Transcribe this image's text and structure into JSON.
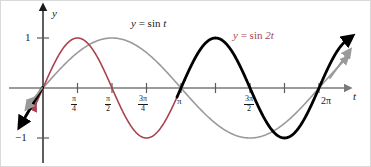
{
  "figure": {
    "kind": "math-graph",
    "width": 371,
    "height": 167,
    "background": "#ffffff",
    "border_color": "#d9d9d9"
  },
  "axes": {
    "t_axis": {
      "label": "t",
      "color": "#7a7a7a",
      "y_pixel": 87,
      "arrow": "right"
    },
    "y_axis": {
      "label": "y",
      "color": "#1a1a1a",
      "x_pixel": 42,
      "arrow": "up"
    },
    "origin": {
      "x": 42,
      "y": 87
    },
    "x_unit_px_per_quarter_pi": 34.5,
    "y_unit_px_per_one": 50,
    "xlim_labels": [
      "0",
      "2π"
    ],
    "ylim": [
      -1,
      1
    ]
  },
  "y_ticks": [
    {
      "label": "1",
      "value": 1
    },
    {
      "label": "−1",
      "value": -1
    }
  ],
  "x_ticks": [
    {
      "num": "π",
      "den": "4",
      "value": 0.7853981634,
      "whole": null
    },
    {
      "num": "π",
      "den": "2",
      "value": 1.5707963268,
      "whole": null
    },
    {
      "num": "3π",
      "den": "4",
      "value": 2.3561944902,
      "whole": null
    },
    {
      "num": null,
      "den": null,
      "value": 3.1415926536,
      "whole": "π"
    },
    {
      "num": "3π",
      "den": "2",
      "value": 4.7123889804,
      "whole": null
    },
    {
      "num": null,
      "den": null,
      "value": 6.2831853072,
      "whole": "2π"
    }
  ],
  "curve_labels": {
    "sin_t": {
      "y": "y",
      "eq": "=",
      "expr": "sin",
      "arg": "t",
      "color": "#1a1a1a"
    },
    "sin_2t": {
      "y": "y",
      "eq": "=",
      "expr": "sin",
      "arg": "2t",
      "color": "#a8434f"
    }
  },
  "chart_data": {
    "type": "line",
    "title": "",
    "xlabel": "t",
    "ylabel": "y",
    "xlim": [
      -0.35,
      7.05
    ],
    "ylim": [
      -1.35,
      1.35
    ],
    "grid": false,
    "legend": "inline-annotations",
    "xtick_labels": [
      "π/4",
      "π/2",
      "3π/4",
      "π",
      "3π/2",
      "2π"
    ],
    "xtick_values": [
      0.785398,
      1.570796,
      2.356194,
      3.141593,
      4.712389,
      6.283185
    ],
    "ytick_labels": [
      "1",
      "−1"
    ],
    "ytick_values": [
      1,
      -1
    ],
    "series": [
      {
        "name": "y = sin t",
        "formula": "sin(t)",
        "color": "#9a9a9a",
        "width": 1.6,
        "t_start": -0.28,
        "t_end": 6.85,
        "period": 6.283185,
        "amplitude": 1,
        "arrow_start": true,
        "arrow_end": true,
        "key_points": [
          {
            "t": 0,
            "y": 0
          },
          {
            "t": 1.570796,
            "y": 1
          },
          {
            "t": 3.141593,
            "y": 0
          },
          {
            "t": 4.712389,
            "y": -1
          },
          {
            "t": 6.283185,
            "y": 0
          }
        ]
      },
      {
        "name": "y = sin 2t (first half, red)",
        "formula": "sin(2t)",
        "color": "#a8434f",
        "width": 1.6,
        "t_start": -0.22,
        "t_end": 3.3,
        "period": 3.141593,
        "amplitude": 1,
        "arrow_start": true,
        "arrow_end": false,
        "key_points": [
          {
            "t": 0,
            "y": 0
          },
          {
            "t": 0.785398,
            "y": 1
          },
          {
            "t": 1.570796,
            "y": 0
          },
          {
            "t": 2.356194,
            "y": -1
          },
          {
            "t": 3.141593,
            "y": 0
          }
        ]
      },
      {
        "name": "y = sin 2t (second half, black)",
        "formula": "sin(2t)",
        "color": "#000000",
        "width": 2.8,
        "t_start": 3.05,
        "t_end": 6.9,
        "period": 3.141593,
        "amplitude": 1,
        "arrow_start": false,
        "arrow_end": true,
        "key_points": [
          {
            "t": 3.141593,
            "y": 0
          },
          {
            "t": 3.926991,
            "y": 1
          },
          {
            "t": 4.712389,
            "y": 0
          },
          {
            "t": 5.497787,
            "y": -1
          },
          {
            "t": 6.283185,
            "y": 0
          }
        ]
      }
    ],
    "annotations": [
      {
        "text": "y = sin t",
        "t": 2.2,
        "y": 1.28,
        "color": "#1a1a1a"
      },
      {
        "text": "y = sin 2t",
        "t": 5.45,
        "y": 1.12,
        "color": "#a8434f"
      }
    ]
  }
}
